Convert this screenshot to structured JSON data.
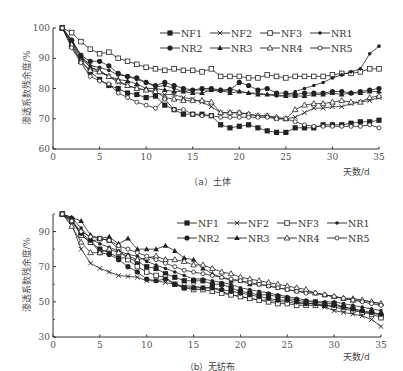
{
  "chart_data": [
    {
      "type": "line",
      "title": "(a) 土体",
      "xlabel": "天数/d",
      "ylabel": "渗透系数残余度/%",
      "xlim": [
        0,
        35
      ],
      "ylim": [
        60,
        100
      ],
      "xticks": [
        0,
        5,
        10,
        15,
        20,
        25,
        30,
        35
      ],
      "yticks": [
        60,
        70,
        80,
        90,
        100
      ],
      "grid": false,
      "legend_position": "upper right",
      "x": [
        1,
        2,
        3,
        4,
        5,
        6,
        7,
        8,
        9,
        10,
        11,
        12,
        13,
        14,
        15,
        16,
        17,
        18,
        19,
        20,
        21,
        22,
        23,
        24,
        25,
        26,
        27,
        28,
        29,
        30,
        31,
        32,
        33,
        34,
        35
      ],
      "series": [
        {
          "name": "NF1",
          "marker": "filled-square",
          "values": [
            100,
            94,
            89,
            85.5,
            83,
            81,
            80,
            78.5,
            78,
            77,
            77.5,
            74.5,
            73,
            71.5,
            71.5,
            71.5,
            71,
            68,
            67,
            67.5,
            68,
            67,
            66,
            65.5,
            65.5,
            67,
            67,
            67,
            68,
            68,
            68,
            68.5,
            69,
            69,
            69.5
          ]
        },
        {
          "name": "NF2",
          "marker": "x",
          "values": [
            100,
            95,
            90,
            87,
            86,
            84,
            82,
            81,
            80,
            79.5,
            78.5,
            78,
            78,
            77,
            76.5,
            75.5,
            74,
            72,
            72,
            72,
            71.5,
            71,
            71,
            70,
            70,
            70.5,
            72,
            73.5,
            73.5,
            74,
            74,
            75,
            75.5,
            76,
            77
          ]
        },
        {
          "name": "NF3",
          "marker": "open-square",
          "values": [
            100,
            98.5,
            95.5,
            93,
            91.5,
            92,
            90,
            89,
            88,
            87,
            86.5,
            86,
            86.5,
            86,
            86,
            85.5,
            86.5,
            84,
            84,
            84,
            83.5,
            83.5,
            84.5,
            84,
            83.5,
            84,
            84,
            84,
            84,
            84.5,
            85,
            85,
            85.5,
            86.5,
            86.5
          ]
        },
        {
          "name": "NR1",
          "marker": "small-filled-circle",
          "values": [
            100,
            96,
            91,
            87.5,
            87,
            86,
            84.5,
            84,
            83,
            82,
            80.5,
            81,
            80,
            79,
            79.5,
            79.5,
            79.5,
            79,
            80,
            79,
            78.5,
            78.5,
            78,
            77.5,
            77.5,
            79,
            80,
            81,
            82,
            83.5,
            84.5,
            85.5,
            86.5,
            91.5,
            94
          ]
        },
        {
          "name": "NR2",
          "marker": "filled-circle",
          "values": [
            100,
            96,
            91,
            89,
            89,
            87.5,
            85,
            84,
            83.5,
            82,
            81,
            82,
            81,
            80,
            79.5,
            80,
            80,
            79.5,
            79.5,
            82,
            81,
            79.5,
            80,
            78.5,
            78.5,
            78,
            78.5,
            78.5,
            78.5,
            79,
            79,
            78.5,
            79,
            79.5,
            80
          ]
        },
        {
          "name": "NR3",
          "marker": "filled-triangle",
          "values": [
            100,
            95.5,
            90.5,
            87,
            85.5,
            84,
            83,
            82.5,
            81.5,
            80,
            80,
            79.5,
            79,
            79,
            78.5,
            78.5,
            79.5,
            79.5,
            78.5,
            79,
            78.5,
            78,
            78,
            78,
            77.5,
            77.5,
            77.5,
            78,
            78,
            78.5,
            78,
            78.5,
            78.5,
            79,
            79
          ]
        },
        {
          "name": "NR4",
          "marker": "open-triangle",
          "values": [
            100,
            94.5,
            89,
            86,
            85.5,
            84,
            82.5,
            81,
            80,
            79.5,
            79,
            77,
            76.5,
            76,
            76,
            76,
            75.5,
            72,
            72,
            72,
            71.5,
            71,
            71,
            70.5,
            70,
            73,
            74.5,
            75,
            75,
            75.5,
            76,
            75.5,
            75.5,
            77,
            77.5
          ]
        },
        {
          "name": "NR5",
          "marker": "small-open-circle",
          "values": [
            100,
            93.5,
            88.5,
            84,
            82.5,
            81.5,
            78.5,
            77,
            75.5,
            74.5,
            73.5,
            76.5,
            73,
            73,
            71.5,
            71,
            71,
            70.5,
            70.5,
            70.5,
            70.5,
            70.5,
            70.5,
            70,
            70,
            69,
            68,
            67.5,
            67.5,
            67.5,
            67.5,
            67.5,
            67.5,
            68,
            67
          ]
        }
      ]
    },
    {
      "type": "line",
      "title": "(b) 无纺布",
      "xlabel": "天数/d",
      "ylabel": "渗透系数残余度/%",
      "xlim": [
        0,
        35
      ],
      "ylim": [
        30,
        100
      ],
      "xticks": [
        0,
        5,
        10,
        15,
        20,
        25,
        30,
        35
      ],
      "yticks": [
        30,
        50,
        70,
        90
      ],
      "grid": false,
      "legend_position": "upper right",
      "x": [
        1,
        2,
        3,
        4,
        5,
        6,
        7,
        8,
        9,
        10,
        11,
        12,
        13,
        14,
        15,
        16,
        17,
        18,
        19,
        20,
        21,
        22,
        23,
        24,
        25,
        26,
        27,
        28,
        29,
        30,
        31,
        32,
        33,
        34,
        35
      ],
      "series": [
        {
          "name": "NF1",
          "marker": "filled-square",
          "values": [
            100,
            97,
            88,
            84,
            80,
            78,
            75,
            75,
            73,
            70,
            69,
            66,
            64,
            62,
            62,
            62,
            60,
            60,
            58,
            56,
            55,
            54,
            54,
            53,
            52,
            51,
            50,
            50,
            49,
            49,
            47,
            46,
            44,
            44,
            42
          ]
        },
        {
          "name": "NF2",
          "marker": "x",
          "values": [
            100,
            94,
            80,
            72,
            69,
            67,
            65,
            64.5,
            64,
            62,
            62,
            61,
            60,
            59,
            59,
            58,
            58,
            56,
            54,
            53,
            52,
            51,
            51,
            50,
            50,
            49,
            49,
            49,
            47,
            45,
            44,
            43,
            42,
            40,
            36
          ]
        },
        {
          "name": "NF3",
          "marker": "open-square",
          "values": [
            100,
            96,
            88,
            84,
            86,
            85,
            80,
            74,
            70,
            67,
            65,
            64,
            60,
            58,
            57,
            57,
            56,
            55,
            54,
            53,
            52,
            51,
            50,
            49,
            49,
            48,
            48,
            48,
            48,
            47,
            46,
            45,
            44,
            43,
            41
          ]
        },
        {
          "name": "NR1",
          "marker": "small-filled-circle",
          "values": [
            100,
            98,
            92,
            86,
            83,
            81,
            79,
            77,
            76,
            73,
            71,
            69,
            67,
            65,
            63,
            63,
            62,
            61,
            60,
            58,
            57,
            56,
            55,
            54,
            53,
            52,
            51,
            50,
            50,
            50,
            49,
            48,
            47,
            46,
            45
          ]
        },
        {
          "name": "NR2",
          "marker": "filled-circle",
          "values": [
            100,
            96,
            89,
            85,
            78,
            77,
            74,
            70,
            67,
            63,
            62,
            63,
            60,
            58,
            58,
            58,
            58,
            57,
            56,
            55,
            54,
            53,
            52,
            51,
            51,
            50,
            49,
            49,
            48,
            48,
            47,
            46,
            45,
            44,
            43
          ]
        },
        {
          "name": "NR3",
          "marker": "filled-triangle",
          "values": [
            100,
            98,
            96,
            88,
            86,
            87,
            83,
            86,
            80,
            80,
            80,
            82,
            79,
            75,
            74,
            69,
            66,
            64,
            62,
            62,
            60,
            60,
            59,
            58,
            57,
            56,
            56,
            55,
            54,
            53,
            52,
            52,
            51,
            50,
            49
          ]
        },
        {
          "name": "NR4",
          "marker": "open-triangle",
          "values": [
            100,
            93,
            84,
            78,
            78,
            80,
            78,
            76,
            74,
            75,
            76,
            74,
            74,
            73,
            71,
            71,
            69,
            67,
            66,
            64,
            63,
            62,
            61,
            60,
            59,
            58,
            57,
            55,
            54,
            53,
            52,
            51,
            51,
            50,
            49
          ]
        },
        {
          "name": "NR5",
          "marker": "small-open-circle",
          "values": [
            100,
            96,
            90,
            87,
            86,
            85,
            82,
            80,
            78,
            76,
            74,
            72,
            70,
            68,
            67,
            66,
            65,
            64,
            63,
            62,
            61,
            60,
            59,
            58,
            57,
            56,
            55,
            55,
            54,
            53,
            52,
            51,
            50,
            49,
            48
          ]
        }
      ]
    }
  ],
  "charts": [
    {
      "caption": "（a）土体",
      "xlabel": "天数/d",
      "ylabel": "渗透系数残余度/%",
      "xtick_labels": [
        "0",
        "5",
        "10",
        "15",
        "20",
        "25",
        "30",
        "35"
      ],
      "ytick_labels": [
        "60",
        "70",
        "80",
        "90",
        "100"
      ],
      "legend": [
        "NF1",
        "NF2",
        "NF3",
        "NR1",
        "NR2",
        "NR3",
        "NR4",
        "NR5"
      ]
    },
    {
      "caption": "（b）无纺布",
      "xlabel": "天数/d",
      "ylabel": "渗透系数残余度/%",
      "xtick_labels": [
        "0",
        "5",
        "10",
        "15",
        "20",
        "25",
        "30",
        "35"
      ],
      "ytick_labels": [
        "30",
        "50",
        "70",
        "90"
      ],
      "legend": [
        "NF1",
        "NF2",
        "NF3",
        "NR1",
        "NR2",
        "NR3",
        "NR4",
        "NR5"
      ]
    }
  ],
  "colors": {
    "line": "#222222",
    "axis": "#333333",
    "text": "#555555"
  }
}
